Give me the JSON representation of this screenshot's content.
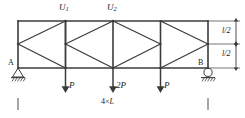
{
  "diagram": {
    "type": "truss-structural-diagram",
    "title": "",
    "stroke_color": "#3b3b3b",
    "text_color": "#1a1a1a",
    "background": "#ffffff",
    "supports": [
      {
        "id": "A",
        "label": "A",
        "kind": "pin",
        "x": 18,
        "y": 68
      },
      {
        "id": "B",
        "label": "B",
        "kind": "roller",
        "x": 208,
        "y": 68
      }
    ],
    "node_labels": [
      {
        "name": "U1",
        "base": "U",
        "subscript": "1",
        "x": 65,
        "y": 21
      },
      {
        "name": "U2",
        "base": "U",
        "subscript": "2",
        "x": 113,
        "y": 21
      }
    ],
    "loads": [
      {
        "label": "P",
        "x": 65,
        "direction": "down"
      },
      {
        "label": "2P",
        "x": 113,
        "direction": "down"
      },
      {
        "label": "P",
        "x": 160,
        "direction": "down"
      }
    ],
    "vertical_dimensions": [
      {
        "label": "l/2",
        "segment": "upper"
      },
      {
        "label": "l/2",
        "segment": "lower"
      }
    ],
    "span_dimension": {
      "label": "4×L",
      "multiplier": "4",
      "times": "×",
      "unit": "L"
    },
    "geometry": {
      "left_x": 18,
      "right_x": 208,
      "top_y": 21,
      "mid_y": 44,
      "bottom_y": 68,
      "panel_count": 4,
      "vertical_x": [
        18,
        65.5,
        113,
        160.5,
        208
      ],
      "mid_nodes_x": [
        18,
        65.5,
        113,
        160.5,
        208
      ]
    }
  }
}
